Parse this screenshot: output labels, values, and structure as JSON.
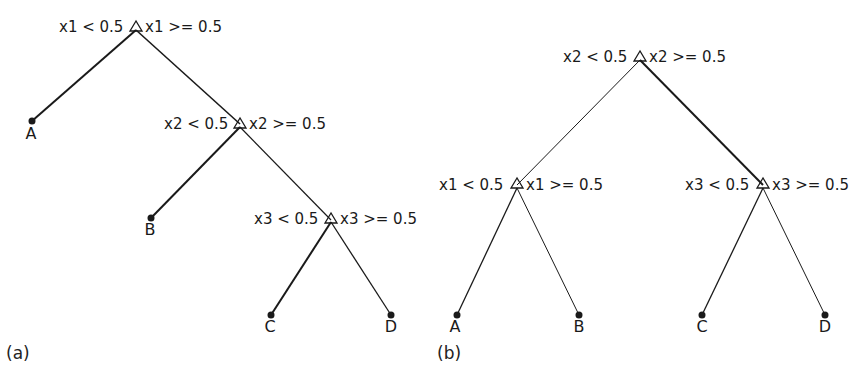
{
  "figure": {
    "panels": [
      {
        "caption": "(a)",
        "splits": [
          {
            "left": "x1 < 0.5",
            "right": "x1 >= 0.5"
          },
          {
            "left": "x2 < 0.5",
            "right": "x2 >= 0.5"
          },
          {
            "left": "x3 < 0.5",
            "right": "x3 >= 0.5"
          }
        ],
        "leaves": [
          "A",
          "B",
          "C",
          "D"
        ]
      },
      {
        "caption": "(b)",
        "splits": [
          {
            "left": "x2 < 0.5",
            "right": "x2 >= 0.5"
          },
          {
            "left": "x1 < 0.5",
            "right": "x1 >= 0.5"
          },
          {
            "left": "x3 < 0.5",
            "right": "x3 >= 0.5"
          }
        ],
        "leaves": [
          "A",
          "B",
          "C",
          "D"
        ]
      }
    ],
    "colors": {
      "line": "#1a1a1a",
      "text": "#1a1a1a",
      "background": "#ffffff"
    }
  }
}
